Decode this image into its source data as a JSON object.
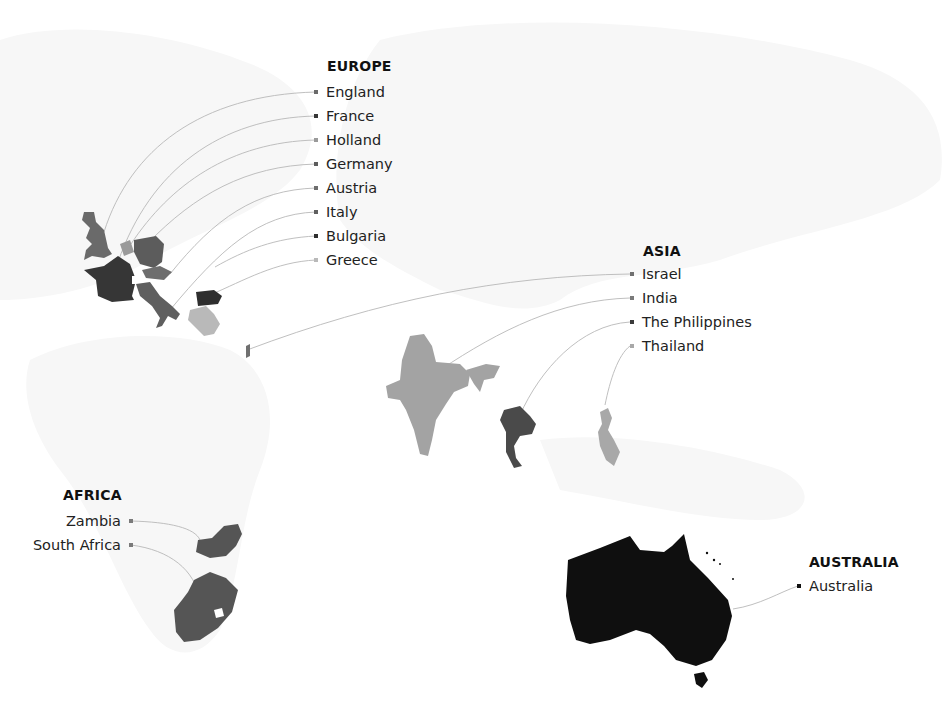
{
  "colors": {
    "background": "#ffffff",
    "world_faint": "#f6f6f6",
    "connector": "#b5b5b5",
    "england": "#6a6a6a",
    "france": "#363636",
    "holland": "#9a9a9a",
    "germany": "#5c5c5c",
    "austria": "#6e6e6e",
    "italy": "#5f5f5f",
    "bulgaria": "#2e2e2e",
    "greece": "#b9b9b9",
    "israel": "#707070",
    "india": "#a3a3a3",
    "thailand": "#4a4a4a",
    "philippines": "#a8a8a8",
    "zambia": "#555555",
    "south_africa": "#555555",
    "australia": "#0f0f0f"
  },
  "regions": {
    "europe": {
      "title": "EUROPE",
      "items": [
        {
          "label": "England",
          "color": "#6a6a6a"
        },
        {
          "label": "France",
          "color": "#363636"
        },
        {
          "label": "Holland",
          "color": "#9a9a9a"
        },
        {
          "label": "Germany",
          "color": "#5c5c5c"
        },
        {
          "label": "Austria",
          "color": "#6e6e6e"
        },
        {
          "label": "Italy",
          "color": "#5f5f5f"
        },
        {
          "label": "Bulgaria",
          "color": "#2e2e2e"
        },
        {
          "label": "Greece",
          "color": "#b9b9b9"
        }
      ]
    },
    "asia": {
      "title": "ASIA",
      "items": [
        {
          "label": "Israel",
          "color": "#707070"
        },
        {
          "label": "India",
          "color": "#7a7a7a"
        },
        {
          "label": "The Philippines",
          "color": "#3a3a3a"
        },
        {
          "label": "Thailand",
          "color": "#a8a8a8"
        }
      ]
    },
    "africa": {
      "title": "AFRICA",
      "items": [
        {
          "label": "Zambia",
          "color": "#7a7a7a"
        },
        {
          "label": "South Africa",
          "color": "#7a7a7a"
        }
      ]
    },
    "australia": {
      "title": "AUSTRALIA",
      "items": [
        {
          "label": "Australia",
          "color": "#111111"
        }
      ]
    }
  }
}
